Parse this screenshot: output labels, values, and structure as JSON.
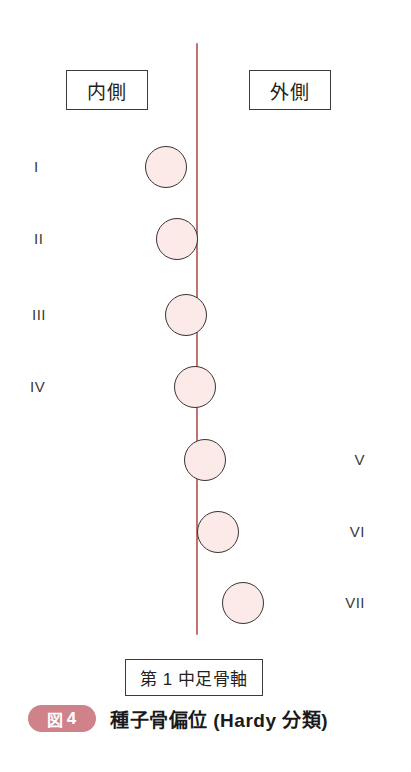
{
  "figure": {
    "badge_word": "図",
    "badge_number": "4",
    "badge_color": "#d0828a",
    "title": "種子骨偏位 (Hardy 分類)",
    "axis_caption": "第 1 中足骨軸",
    "axis_color": "#c0736f",
    "circle_fill": "#fbeae8",
    "circle_stroke": "#3a3335",
    "background": "#ffffff"
  },
  "side_labels": {
    "medial": "内側",
    "lateral": "外側"
  },
  "chart_data": {
    "type": "scatter",
    "title": "種子骨偏位 (Hardy 分類)",
    "xlabel": "第 1 中足骨軸",
    "ylabel": "",
    "grid": false,
    "legend": "none",
    "note": "Hardy classification of sesamoid displacement: grades I-VII, each circle is the sesamoid position relative to the 1st metatarsal axis (red vertical line at x=196).",
    "axis_line": {
      "x": 196,
      "y_top": 43,
      "y_bottom": 635
    },
    "categories": [
      "I",
      "II",
      "III",
      "IV",
      "V",
      "VI",
      "VII"
    ],
    "points": [
      {
        "grade": "I",
        "cx": 166,
        "cy": 167,
        "r": 21,
        "label_side": "left",
        "label_x": 34,
        "offset_from_axis": -30
      },
      {
        "grade": "II",
        "cx": 177,
        "cy": 239,
        "r": 21,
        "label_side": "left",
        "label_x": 34,
        "offset_from_axis": -19
      },
      {
        "grade": "III",
        "cx": 186,
        "cy": 315,
        "r": 21,
        "label_side": "left",
        "label_x": 32,
        "offset_from_axis": -10
      },
      {
        "grade": "IV",
        "cx": 195,
        "cy": 387,
        "r": 21,
        "label_side": "left",
        "label_x": 30,
        "offset_from_axis": -1
      },
      {
        "grade": "V",
        "cx": 205,
        "cy": 460,
        "r": 21,
        "label_side": "right",
        "label_x": 365,
        "offset_from_axis": 9
      },
      {
        "grade": "VI",
        "cx": 218,
        "cy": 532,
        "r": 21,
        "label_side": "right",
        "label_x": 365,
        "offset_from_axis": 22
      },
      {
        "grade": "VII",
        "cx": 243,
        "cy": 603,
        "r": 21,
        "label_side": "right",
        "label_x": 365,
        "offset_from_axis": 47
      }
    ],
    "boxes": [
      {
        "name": "medial",
        "text": "内側",
        "x": 66,
        "y": 70,
        "w": 82,
        "h": 40
      },
      {
        "name": "lateral",
        "text": "外側",
        "x": 249,
        "y": 70,
        "w": 82,
        "h": 40
      },
      {
        "name": "axis",
        "text": "第 1 中足骨軸",
        "x": 125,
        "y": 659,
        "w": 138,
        "h": 37
      }
    ]
  }
}
